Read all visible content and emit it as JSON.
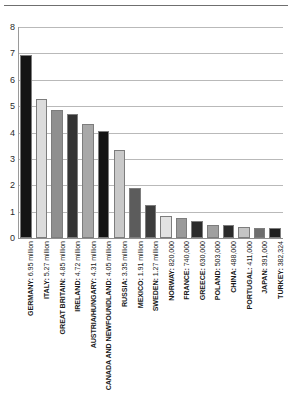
{
  "chart_data": {
    "type": "bar",
    "title": "",
    "subtitle": "",
    "xlabel": "",
    "ylabel": "",
    "ylim": [
      0,
      8
    ],
    "yticks": [
      0,
      1,
      2,
      3,
      4,
      5,
      6,
      7,
      8
    ],
    "grid": true,
    "legend": "none",
    "unit_note": "values in millions",
    "categories": [
      "GERMANY",
      "ITALY",
      "GREAT BRITAIN",
      "IRELAND",
      "AUSTRIA/HUNGARY",
      "CANADA AND NEWFOUNDLAND",
      "RUSSIA",
      "MEXICO",
      "SWEDEN",
      "NORWAY",
      "FRANCE",
      "GREECE",
      "POLAND",
      "CHINA",
      "PORTUGAL",
      "JAPAN",
      "TURKEY"
    ],
    "values": [
      6.95,
      5.27,
      4.85,
      4.72,
      4.31,
      4.05,
      3.35,
      1.91,
      1.27,
      0.82,
      0.74,
      0.63,
      0.503,
      0.488,
      0.411,
      0.391,
      0.382324
    ],
    "value_labels": [
      "6.95 million",
      "5.27 million",
      "4.85 million",
      "4.72 million",
      "4.31 million",
      "4.05 million",
      "3.35 million",
      "1.91 million",
      "1.27 million",
      "820,000",
      "740,000",
      "630,000",
      "503,000",
      "488,000",
      "411,000",
      "391,000",
      "382,324"
    ],
    "tick_labels": [
      "GERMANY: 6.95 million",
      "ITALY: 5.27 million",
      "GREAT BRITAIN: 4.85 million",
      "IRELAND: 4.72 million",
      "AUSTRIA/HUNGARY: 4.31 million",
      "CANADA AND NEWFOUNDLAND: 4.05 million",
      "RUSSIA: 3.35 million",
      "MEXICO: 1.91 million",
      "SWEDEN: 1.27 million",
      "NORWAY: 820,000",
      "FRANCE: 740,000",
      "GREECE: 630,000",
      "POLAND: 503,000",
      "CHINA: 488,000",
      "PORTUGAL: 411,000",
      "JAPAN: 391,000",
      "TURKEY: 382,324"
    ],
    "bar_colors": [
      "#141414",
      "#dcdcdc",
      "#8f8f8f",
      "#333333",
      "#a8a8a8",
      "#141414",
      "#c9c9c9",
      "#5c5c5c",
      "#3d3d3d",
      "#e2e2e2",
      "#9a9a9a",
      "#2b2b2b",
      "#a0a0a0",
      "#2b2b2b",
      "#c4c4c4",
      "#6e6e6e",
      "#1f1f1f"
    ],
    "grid_color": "#b9b9b9",
    "axis_color": "#8f8f8f",
    "background": "#ffffff"
  }
}
